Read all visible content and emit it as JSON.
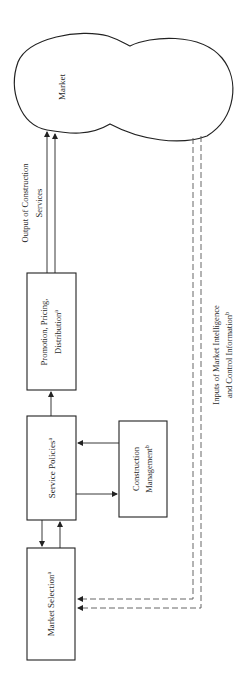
{
  "diagram": {
    "orientation": "rotated-90-ccw",
    "nodes": {
      "market": {
        "label": "Market",
        "shape": "cloud"
      },
      "promotion": {
        "line1": "Promotion, Pricing,",
        "line2": "Distribution",
        "sup": "a"
      },
      "service_policies": {
        "label": "Service Policies",
        "sup": "a"
      },
      "construction_management": {
        "line1": "Construction",
        "line2": "Management",
        "sup": "b"
      },
      "market_selection": {
        "label": "Market Selection",
        "sup": "a"
      }
    },
    "flows": {
      "output": {
        "line1": "Output of Construction",
        "line2": "Services"
      },
      "inputs": {
        "line1": "Inputs of Market Intelligence",
        "line2": "and Control Information",
        "sup": "b"
      }
    },
    "colors": {
      "stroke": "#222222",
      "dashed": "#555555",
      "background": "#ffffff"
    }
  }
}
